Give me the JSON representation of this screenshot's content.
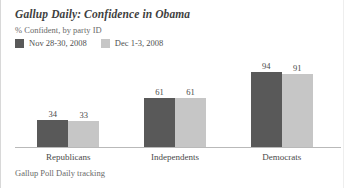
{
  "header": {
    "title": "Gallup Daily: Confidence in Obama",
    "subtitle": "% Confident, by party ID"
  },
  "footer": {
    "source": "Gallup Poll Daily tracking"
  },
  "colors": {
    "series_dark": "#595959",
    "series_light": "#c6c6c6",
    "baseline": "#b9b9b9",
    "text": "#4a4a4a",
    "background": "#ffffff"
  },
  "chart_data": {
    "type": "bar",
    "title": "Gallup Daily: Confidence in Obama",
    "subtitle": "% Confident, by party ID",
    "xlabel": "",
    "ylabel": "% Confident",
    "ylim": [
      0,
      100
    ],
    "grid": false,
    "legend_position": "top-left",
    "categories": [
      "Republicans",
      "Independents",
      "Democrats"
    ],
    "series": [
      {
        "name": "Nov 28-30, 2008",
        "color": "#595959",
        "values": [
          34,
          61,
          94
        ]
      },
      {
        "name": "Dec 1-3, 2008",
        "color": "#c6c6c6",
        "values": [
          33,
          61,
          91
        ]
      }
    ],
    "source": "Gallup Poll Daily tracking"
  }
}
